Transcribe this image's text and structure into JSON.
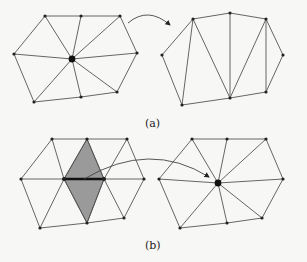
{
  "figure": {
    "panels": [
      {
        "id": "a",
        "label": "(a)",
        "label_pos": [
          145,
          117
        ],
        "description": "Vertex removal: star-shaped neighborhood of a center vertex is removed and the hole retriangulated",
        "before": {
          "vertices": [
            [
              45,
              16
            ],
            [
              81,
              16
            ],
            [
              120,
              16
            ],
            [
              14,
              54
            ],
            [
              137,
              53
            ],
            [
              34,
              102
            ],
            [
              81,
              97
            ],
            [
              117,
              92
            ]
          ],
          "center": [
            72,
            59
          ],
          "edges": [
            [
              0,
              1
            ],
            [
              1,
              2
            ],
            [
              2,
              4
            ],
            [
              4,
              7
            ],
            [
              7,
              6
            ],
            [
              6,
              5
            ],
            [
              5,
              3
            ],
            [
              3,
              0
            ],
            [
              0,
              "c"
            ],
            [
              1,
              "c"
            ],
            [
              2,
              "c"
            ],
            [
              3,
              "c"
            ],
            [
              4,
              "c"
            ],
            [
              5,
              "c"
            ],
            [
              6,
              "c"
            ],
            [
              7,
              "c"
            ]
          ]
        },
        "after": {
          "vertices": [
            [
              193,
              19
            ],
            [
              230,
              13
            ],
            [
              266,
              19
            ],
            [
              162,
              55
            ],
            [
              283,
              55
            ],
            [
              182,
              105
            ],
            [
              230,
              98
            ],
            [
              266,
              92
            ]
          ],
          "edges": [
            [
              3,
              0
            ],
            [
              0,
              1
            ],
            [
              1,
              2
            ],
            [
              2,
              4
            ],
            [
              4,
              7
            ],
            [
              7,
              6
            ],
            [
              6,
              5
            ],
            [
              5,
              3
            ],
            [
              0,
              5
            ],
            [
              0,
              6
            ],
            [
              1,
              6
            ],
            [
              2,
              6
            ],
            [
              2,
              7
            ]
          ]
        },
        "arrow": {
          "path": "M128,23 Q148,6 170,25"
        }
      },
      {
        "id": "b",
        "label": "(b)",
        "label_pos": [
          145,
          239
        ],
        "description": "Edge collapse: highlighted edge collapsed to a single vertex, removing the two shaded triangles",
        "before": {
          "vertices": [
            [
              52,
              139
            ],
            [
              87,
              139
            ],
            [
              127,
              139
            ],
            [
              21,
              179
            ],
            [
              64,
              179
            ],
            [
              104,
              179
            ],
            [
              144,
              179
            ],
            [
              40,
              228
            ],
            [
              87,
              223
            ],
            [
              124,
              218
            ]
          ],
          "edges": [
            [
              0,
              1
            ],
            [
              1,
              2
            ],
            [
              0,
              3
            ],
            [
              3,
              4
            ],
            [
              4,
              5
            ],
            [
              5,
              6
            ],
            [
              2,
              6
            ],
            [
              3,
              7
            ],
            [
              7,
              8
            ],
            [
              8,
              9
            ],
            [
              9,
              6
            ],
            [
              0,
              4
            ],
            [
              1,
              4
            ],
            [
              1,
              5
            ],
            [
              2,
              5
            ],
            [
              7,
              4
            ],
            [
              8,
              4
            ],
            [
              8,
              5
            ],
            [
              9,
              5
            ]
          ],
          "shaded_polygon": [
            [
              87,
              139
            ],
            [
              64,
              179
            ],
            [
              87,
              223
            ],
            [
              104,
              179
            ]
          ],
          "collapsed_edge": [
            [
              64,
              179
            ],
            [
              104,
              179
            ]
          ]
        },
        "after": {
          "vertices": [
            [
              192,
              139
            ],
            [
              227,
              139
            ],
            [
              266,
              139
            ],
            [
              159,
              179
            ],
            [
              283,
              179
            ],
            [
              180,
              228
            ],
            [
              227,
              223
            ],
            [
              262,
              218
            ]
          ],
          "center": [
            218,
            183
          ],
          "edges": [
            [
              0,
              1
            ],
            [
              1,
              2
            ],
            [
              2,
              4
            ],
            [
              4,
              7
            ],
            [
              7,
              6
            ],
            [
              6,
              5
            ],
            [
              5,
              3
            ],
            [
              3,
              0
            ],
            [
              0,
              "c"
            ],
            [
              1,
              "c"
            ],
            [
              2,
              "c"
            ],
            [
              3,
              "c"
            ],
            [
              4,
              "c"
            ],
            [
              5,
              "c"
            ],
            [
              6,
              "c"
            ],
            [
              7,
              "c"
            ]
          ]
        },
        "arrow": {
          "path": "M84,179 Q150,140 209,177"
        }
      }
    ]
  }
}
